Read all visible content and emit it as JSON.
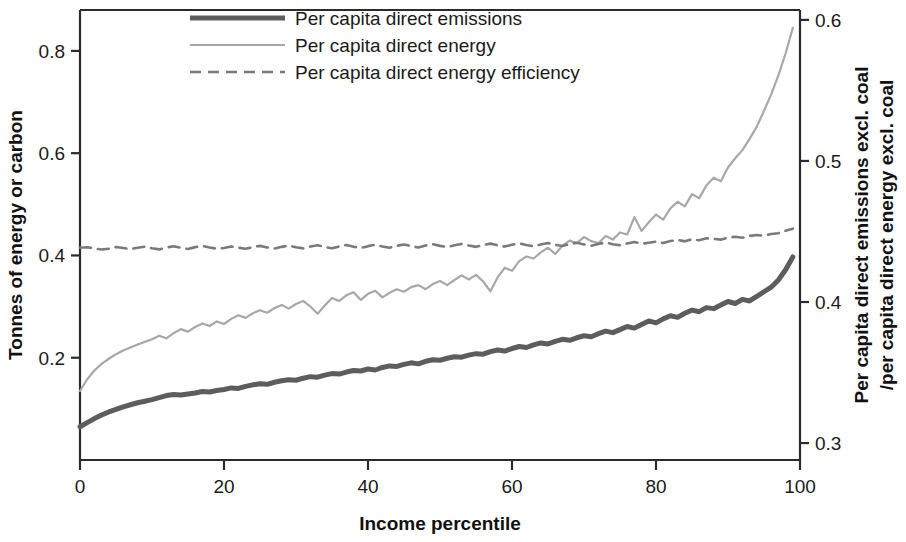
{
  "chart_data": {
    "type": "line",
    "title": "",
    "xlabel": "Income percentile",
    "ylabel": "Tonnes of energy or carbon",
    "y2label": "Per capita direct emissions excl. coal /per capita direct energy excl. coal",
    "y2label_line1": "Per capita direct emissions excl. coal",
    "y2label_line2": "/per capita direct energy excl. coal",
    "xlim": [
      0,
      100
    ],
    "ylim": [
      0.0,
      0.88
    ],
    "y2lim": [
      0.288,
      0.607
    ],
    "xticks": [
      0,
      20,
      40,
      60,
      80,
      100
    ],
    "xtick_labels": [
      "0",
      "20",
      "40",
      "60",
      "80",
      "100"
    ],
    "yticks": [
      0.2,
      0.4,
      0.6,
      0.8
    ],
    "ytick_labels": [
      "0.2",
      "0.4",
      "0.6",
      "0.8"
    ],
    "y2ticks": [
      0.3,
      0.4,
      0.5,
      0.6
    ],
    "y2tick_labels": [
      "0.3",
      "0.4",
      "0.5",
      "0.6"
    ],
    "grid": false,
    "legend_position": "top-center",
    "x": [
      0,
      1,
      2,
      3,
      4,
      5,
      6,
      7,
      8,
      9,
      10,
      11,
      12,
      13,
      14,
      15,
      16,
      17,
      18,
      19,
      20,
      21,
      22,
      23,
      24,
      25,
      26,
      27,
      28,
      29,
      30,
      31,
      32,
      33,
      34,
      35,
      36,
      37,
      38,
      39,
      40,
      41,
      42,
      43,
      44,
      45,
      46,
      47,
      48,
      49,
      50,
      51,
      52,
      53,
      54,
      55,
      56,
      57,
      58,
      59,
      60,
      61,
      62,
      63,
      64,
      65,
      66,
      67,
      68,
      69,
      70,
      71,
      72,
      73,
      74,
      75,
      76,
      77,
      78,
      79,
      80,
      81,
      82,
      83,
      84,
      85,
      86,
      87,
      88,
      89,
      90,
      91,
      92,
      93,
      94,
      95,
      96,
      97,
      98,
      99
    ],
    "series": [
      {
        "name": "Per capita direct emissions",
        "axis": "left",
        "color": "#5d5d5d",
        "linewidth": 5,
        "dash": "solid",
        "values": [
          0.065,
          0.073,
          0.081,
          0.088,
          0.094,
          0.099,
          0.104,
          0.108,
          0.112,
          0.115,
          0.118,
          0.122,
          0.126,
          0.128,
          0.127,
          0.129,
          0.131,
          0.134,
          0.133,
          0.136,
          0.138,
          0.141,
          0.14,
          0.144,
          0.147,
          0.149,
          0.148,
          0.152,
          0.155,
          0.157,
          0.156,
          0.16,
          0.163,
          0.162,
          0.166,
          0.169,
          0.168,
          0.172,
          0.175,
          0.174,
          0.178,
          0.176,
          0.181,
          0.184,
          0.183,
          0.187,
          0.19,
          0.188,
          0.193,
          0.196,
          0.195,
          0.199,
          0.202,
          0.201,
          0.205,
          0.208,
          0.207,
          0.212,
          0.215,
          0.213,
          0.218,
          0.222,
          0.22,
          0.225,
          0.229,
          0.227,
          0.232,
          0.236,
          0.234,
          0.239,
          0.243,
          0.241,
          0.247,
          0.252,
          0.249,
          0.255,
          0.261,
          0.258,
          0.265,
          0.272,
          0.268,
          0.276,
          0.282,
          0.279,
          0.287,
          0.293,
          0.29,
          0.298,
          0.296,
          0.303,
          0.31,
          0.306,
          0.314,
          0.311,
          0.32,
          0.329,
          0.338,
          0.352,
          0.372,
          0.397
        ]
      },
      {
        "name": "Per capita direct energy",
        "axis": "left",
        "color": "#a8a8a8",
        "linewidth": 2.2,
        "dash": "solid",
        "values": [
          0.135,
          0.158,
          0.175,
          0.188,
          0.198,
          0.207,
          0.214,
          0.22,
          0.226,
          0.231,
          0.236,
          0.243,
          0.238,
          0.248,
          0.256,
          0.251,
          0.26,
          0.267,
          0.262,
          0.271,
          0.266,
          0.276,
          0.283,
          0.278,
          0.287,
          0.293,
          0.288,
          0.297,
          0.303,
          0.296,
          0.305,
          0.311,
          0.3,
          0.286,
          0.302,
          0.317,
          0.311,
          0.322,
          0.328,
          0.313,
          0.325,
          0.331,
          0.318,
          0.327,
          0.334,
          0.329,
          0.338,
          0.342,
          0.334,
          0.344,
          0.35,
          0.342,
          0.352,
          0.361,
          0.353,
          0.362,
          0.349,
          0.33,
          0.357,
          0.376,
          0.37,
          0.389,
          0.398,
          0.394,
          0.406,
          0.415,
          0.403,
          0.419,
          0.429,
          0.424,
          0.436,
          0.428,
          0.424,
          0.438,
          0.431,
          0.445,
          0.441,
          0.475,
          0.448,
          0.465,
          0.48,
          0.47,
          0.492,
          0.505,
          0.496,
          0.52,
          0.512,
          0.537,
          0.552,
          0.545,
          0.572,
          0.59,
          0.606,
          0.628,
          0.652,
          0.683,
          0.715,
          0.752,
          0.795,
          0.845
        ]
      },
      {
        "name": "Per capita direct energy efficiency",
        "axis": "right",
        "color": "#7a7a7a",
        "linewidth": 2.6,
        "dash": "dashed",
        "values": [
          0.4385,
          0.4388,
          0.438,
          0.4372,
          0.4378,
          0.439,
          0.4383,
          0.4375,
          0.4385,
          0.4392,
          0.4381,
          0.4373,
          0.4386,
          0.4395,
          0.4384,
          0.4376,
          0.4389,
          0.4397,
          0.4386,
          0.4378,
          0.4383,
          0.4394,
          0.4385,
          0.4377,
          0.439,
          0.4398,
          0.4387,
          0.4379,
          0.4391,
          0.44,
          0.4388,
          0.438,
          0.4393,
          0.4402,
          0.439,
          0.4381,
          0.4394,
          0.4404,
          0.4392,
          0.4383,
          0.4396,
          0.4406,
          0.4394,
          0.4385,
          0.4398,
          0.4408,
          0.4396,
          0.4387,
          0.44,
          0.441,
          0.4398,
          0.4389,
          0.4402,
          0.4412,
          0.44,
          0.4391,
          0.4404,
          0.4414,
          0.4402,
          0.4393,
          0.4406,
          0.4416,
          0.4404,
          0.4395,
          0.4408,
          0.4418,
          0.4406,
          0.4397,
          0.441,
          0.442,
          0.4408,
          0.4399,
          0.4412,
          0.4422,
          0.441,
          0.4402,
          0.4415,
          0.4425,
          0.4413,
          0.442,
          0.4428,
          0.4418,
          0.4432,
          0.444,
          0.443,
          0.4445,
          0.4438,
          0.4452,
          0.4448,
          0.4442,
          0.4456,
          0.4462,
          0.4455,
          0.4468,
          0.4475,
          0.447,
          0.4482,
          0.4488,
          0.4505,
          0.452
        ]
      }
    ],
    "legend": [
      {
        "label": "Per capita direct emissions",
        "color": "#5d5d5d",
        "style": "thick-solid"
      },
      {
        "label": "Per capita direct energy",
        "color": "#a8a8a8",
        "style": "thin-solid"
      },
      {
        "label": "Per capita direct energy efficiency",
        "color": "#7a7a7a",
        "style": "dashed"
      }
    ]
  }
}
